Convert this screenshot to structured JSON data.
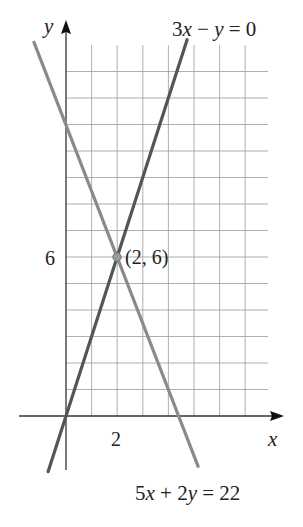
{
  "chart_data": {
    "type": "line",
    "title": "",
    "xlabel": "x",
    "ylabel": "y",
    "x_tick_labels": [
      {
        "value": 2,
        "label": "2"
      }
    ],
    "y_tick_labels": [
      {
        "value": 6,
        "label": "6"
      }
    ],
    "grid": true,
    "grid_x_range": [
      0,
      7.9
    ],
    "grid_y_range": [
      0,
      14
    ],
    "grid_step": 1,
    "xlim": [
      -1.8,
      8.5
    ],
    "ylim": [
      -2.1,
      15
    ],
    "series": [
      {
        "name": "3x − y = 0",
        "equation": "y = 3x",
        "color": "#555555",
        "points": [
          [
            -0.7,
            -2.1
          ],
          [
            4.73,
            14.2
          ]
        ]
      },
      {
        "name": "5x + 2y = 22",
        "equation": "y = 11 − 2.5x",
        "color": "#8a8a8a",
        "points": [
          [
            -1.25,
            14.1
          ],
          [
            5.16,
            -1.9
          ]
        ]
      }
    ],
    "annotations": [
      {
        "type": "point",
        "x": 2,
        "y": 6,
        "label": "(2, 6)"
      }
    ]
  },
  "labels": {
    "y_axis": "y",
    "x_axis": "x",
    "tick_x_2": "2",
    "tick_y_6": "6",
    "intersection": "(2, 6)",
    "eq1_a": "3",
    "eq1_b": "x",
    "eq1_c": " − ",
    "eq1_d": "y",
    "eq1_e": " = 0",
    "eq2_a": "5",
    "eq2_b": "x",
    "eq2_c": " + 2",
    "eq2_d": "y",
    "eq2_e": " = 22"
  }
}
